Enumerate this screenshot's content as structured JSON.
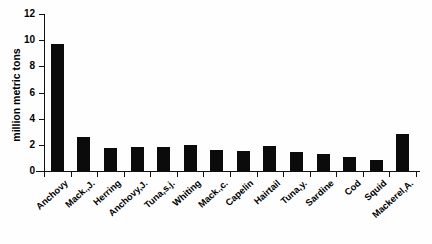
{
  "chart_data": {
    "type": "bar",
    "title": "",
    "xlabel": "",
    "ylabel": "million metric tons",
    "ylim": [
      0,
      12
    ],
    "yticks": [
      0,
      2,
      4,
      6,
      8,
      10,
      12
    ],
    "grid": false,
    "legend": null,
    "bar_color": "#0b0b0b",
    "categories": [
      "Anchovy",
      "Mack.,J.",
      "Herring",
      "Anchovy,J.",
      "Tuna,s.j.",
      "Whiting",
      "Mack.,c.",
      "Capelin",
      "Hairtail",
      "Tuna,y.",
      "Sardine",
      "Cod",
      "Squid",
      "Mackerel,A."
    ],
    "values": [
      9.7,
      2.6,
      1.75,
      1.85,
      1.85,
      2.0,
      1.6,
      1.5,
      1.9,
      1.45,
      1.3,
      1.1,
      0.85,
      2.8
    ]
  }
}
